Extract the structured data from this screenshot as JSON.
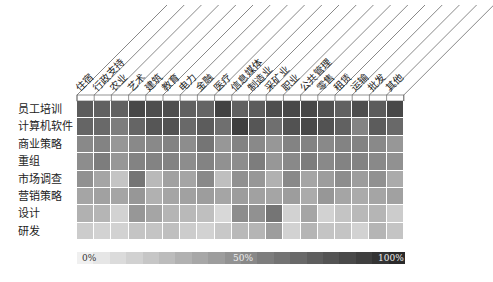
{
  "chart_data": {
    "type": "heatmap",
    "title": "",
    "columns": [
      "住宿",
      "行政支持",
      "农业",
      "艺术",
      "建筑",
      "教育",
      "电力",
      "金融",
      "医疗",
      "信息媒体",
      "制造业",
      "采矿业",
      "职业",
      "公共管理",
      "零售",
      "租赁",
      "运输",
      "批发",
      "其他"
    ],
    "rows": [
      "员工培训",
      "计算机软件",
      "商业策略",
      "重组",
      "市场调查",
      "营销策略",
      "设计",
      "研发"
    ],
    "values": [
      [
        75,
        72,
        72,
        85,
        82,
        82,
        72,
        70,
        88,
        72,
        75,
        82,
        85,
        85,
        80,
        72,
        82,
        75,
        85
      ],
      [
        70,
        68,
        58,
        70,
        78,
        80,
        68,
        75,
        65,
        90,
        78,
        65,
        80,
        85,
        80,
        72,
        55,
        75,
        68
      ],
      [
        52,
        55,
        45,
        52,
        52,
        55,
        50,
        62,
        45,
        55,
        52,
        45,
        55,
        55,
        52,
        55,
        55,
        52,
        45
      ],
      [
        50,
        58,
        45,
        55,
        55,
        55,
        50,
        55,
        48,
        50,
        58,
        45,
        52,
        58,
        52,
        55,
        55,
        52,
        48
      ],
      [
        48,
        38,
        22,
        62,
        28,
        40,
        38,
        52,
        25,
        48,
        45,
        32,
        52,
        38,
        42,
        50,
        42,
        48,
        35
      ],
      [
        38,
        40,
        38,
        45,
        32,
        38,
        40,
        42,
        38,
        42,
        40,
        38,
        42,
        35,
        45,
        38,
        35,
        38,
        40
      ],
      [
        32,
        30,
        15,
        45,
        38,
        30,
        28,
        25,
        12,
        50,
        48,
        62,
        15,
        38,
        15,
        22,
        28,
        30,
        18
      ],
      [
        18,
        15,
        15,
        22,
        22,
        25,
        18,
        15,
        20,
        28,
        30,
        42,
        15,
        30,
        22,
        22,
        15,
        30,
        22
      ]
    ],
    "value_range": [
      0,
      100
    ],
    "unit": "%",
    "color_scale": {
      "low": "#f0f0f0",
      "high": "#2a2a2a"
    },
    "legend": {
      "position": "bottom",
      "ticks": [
        "0%",
        "50%",
        "100%"
      ]
    }
  },
  "legend": {
    "min_label": "0%",
    "mid_label": "50%",
    "max_label": "100%"
  }
}
